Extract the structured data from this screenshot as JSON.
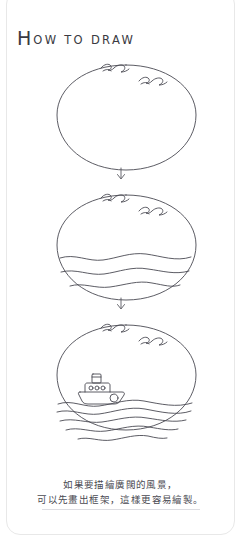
{
  "page": {
    "background_color": "#ffffff",
    "ink_color": "#4a4a52",
    "card_border_color": "#e8e8e8"
  },
  "header": {
    "title_initial": "H",
    "title_rest": "OW TO DRAW",
    "title_full": "How to draw"
  },
  "steps": [
    {
      "index": 1,
      "name": "step-outline",
      "description": "Empty oval outline with two flying birds on the upper right edge",
      "elements": [
        "oval",
        "bird",
        "bird"
      ]
    },
    {
      "index": 2,
      "name": "step-waves",
      "description": "Oval with three wavy sea lines filling the lower third",
      "elements": [
        "oval",
        "bird",
        "bird",
        "wave",
        "wave",
        "wave"
      ]
    },
    {
      "index": 3,
      "name": "step-boat",
      "description": "Oval with a steamboat on the water and denser waves",
      "elements": [
        "oval",
        "bird",
        "bird",
        "boat",
        "wave",
        "wave",
        "wave",
        "wave",
        "wave"
      ]
    }
  ],
  "arrows": [
    {
      "name": "arrow-step1-to-step2",
      "glyph": "down-arrow"
    },
    {
      "name": "arrow-step2-to-step3",
      "glyph": "down-arrow"
    }
  ],
  "caption": {
    "line1": "如果要描繪廣闊的風景，",
    "line2": "可以先畫出框架，這樣更容易繪製。"
  }
}
